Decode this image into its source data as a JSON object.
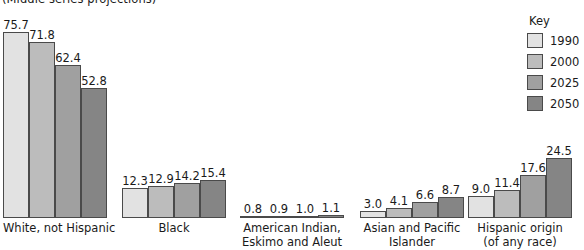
{
  "chart_data": {
    "type": "bar",
    "title": "(Middle series projections)",
    "subtitle": "",
    "xlabel": "",
    "ylabel": "",
    "ylim": [
      0,
      80
    ],
    "grid": false,
    "legend_position": "right",
    "legend_title": "Key",
    "categories": [
      "White, not Hispanic",
      "Black",
      "American Indian, Eskimo and Aleut",
      "Asian and Pacific Islander",
      "Hispanic origin (of any race)"
    ],
    "category_labels": [
      {
        "line1": "White, not Hispanic",
        "line2": ""
      },
      {
        "line1": "Black",
        "line2": ""
      },
      {
        "line1": "American Indian,",
        "line2": "Eskimo and Aleut"
      },
      {
        "line1": "Asian and Pacific",
        "line2": "Islander"
      },
      {
        "line1": "Hispanic origin",
        "line2": "(of any race)"
      }
    ],
    "series": [
      {
        "name": "1990",
        "color": "#e2e2e2",
        "values": [
          75.7,
          12.3,
          0.8,
          3.0,
          9.0
        ]
      },
      {
        "name": "2000",
        "color": "#bcbcbc",
        "values": [
          71.8,
          12.9,
          0.9,
          4.1,
          11.4
        ]
      },
      {
        "name": "2025",
        "color": "#a0a0a0",
        "values": [
          62.4,
          14.2,
          1.0,
          6.6,
          17.6
        ]
      },
      {
        "name": "2050",
        "color": "#858585",
        "values": [
          52.8,
          15.4,
          1.1,
          8.7,
          24.5
        ]
      }
    ],
    "value_labels": [
      [
        "75.7",
        "71.8",
        "62.4",
        "52.8"
      ],
      [
        "12.3",
        "12.9",
        "14.2",
        "15.4"
      ],
      [
        "0.8",
        "0.9",
        "1.0",
        "1.1"
      ],
      [
        "3.0",
        "4.1",
        "6.6",
        "8.7"
      ],
      [
        "9.0",
        "11.4",
        "17.6",
        "24.5"
      ]
    ]
  },
  "legend": {
    "title": "Key",
    "items": [
      {
        "label": "1990",
        "color": "#e2e2e2"
      },
      {
        "label": "2000",
        "color": "#bcbcbc"
      },
      {
        "label": "2025",
        "color": "#a0a0a0"
      },
      {
        "label": "2050",
        "color": "#858585"
      }
    ]
  }
}
